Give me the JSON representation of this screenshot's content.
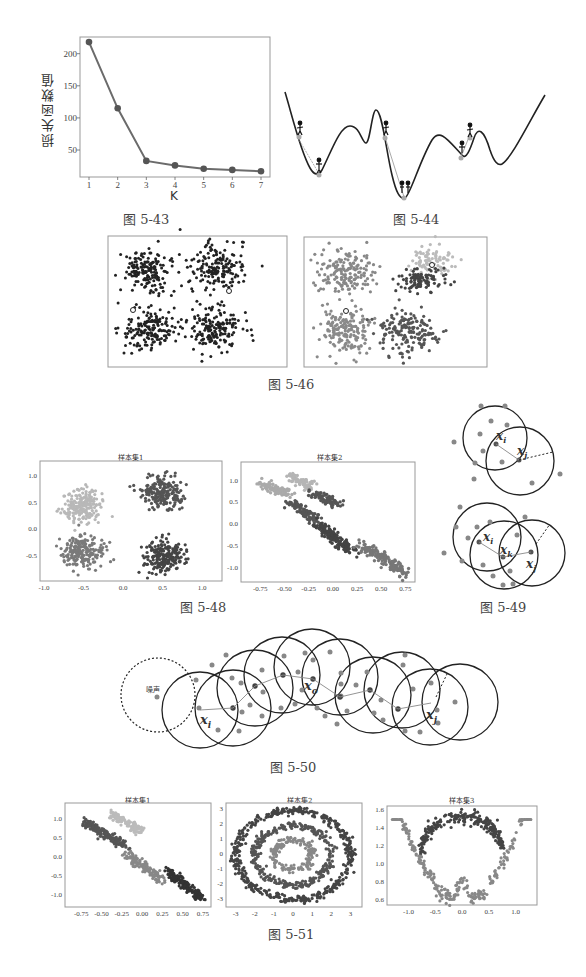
{
  "figures": {
    "fig_5_43": {
      "caption": "图 5-43",
      "ylabel": "损失函数值",
      "xlabel": "K",
      "y_ticks": [
        "200",
        "150",
        "100",
        "50"
      ],
      "x_ticks": [
        "1",
        "2",
        "3",
        "4",
        "5",
        "6",
        "7"
      ]
    },
    "fig_5_44": {
      "caption": "图 5-44"
    },
    "fig_5_46": {
      "caption": "图 5-46"
    },
    "fig_5_48": {
      "caption": "图 5-48",
      "left": {
        "title": "样本集1",
        "y_ticks": [
          "1.0",
          "0.5",
          "0.0",
          "-0.5"
        ],
        "x_ticks": [
          "-1.0",
          "-0.5",
          "0.0",
          "0.5",
          "1.0"
        ]
      },
      "right": {
        "title": "样本集2",
        "y_ticks": [
          "1.0",
          "0.5",
          "0.0",
          "-0.5",
          "-1.0"
        ],
        "x_ticks": [
          "-0.75",
          "-0.50",
          "-0.25",
          "0.00",
          "0.25",
          "0.50",
          "0.75"
        ]
      }
    },
    "fig_5_49": {
      "caption": "图 5-49",
      "labels": {
        "xi": "x",
        "xi_sub": "i",
        "xj": "x",
        "xj_sub": "j",
        "xk": "x",
        "xk_sub": "k",
        "radius": "ε"
      }
    },
    "fig_5_50": {
      "caption": "图 5-50",
      "noise_label": "噪声",
      "labels": {
        "xi": "x",
        "xi_sub": "i",
        "xo": "x",
        "xo_sub": "o",
        "xj": "x",
        "xj_sub": "j",
        "radius": "ε"
      }
    },
    "fig_5_51": {
      "caption": "图 5-51",
      "p1": {
        "title": "样本集1",
        "y_ticks": [
          "1.0",
          "0.5",
          "0.0",
          "-0.5",
          "-1.0"
        ],
        "x_ticks": [
          "-0.75",
          "-0.50",
          "-0.25",
          "0.00",
          "0.25",
          "0.50",
          "0.75"
        ]
      },
      "p2": {
        "title": "样本集2",
        "y_ticks": [
          "3",
          "2",
          "1",
          "0",
          "-1",
          "-2",
          "-3"
        ],
        "x_ticks": [
          "-3",
          "-2",
          "-1",
          "0",
          "1",
          "2",
          "3"
        ]
      },
      "p3": {
        "title": "样本集3",
        "y_ticks": [
          "1.6",
          "1.4",
          "1.2",
          "1.0",
          "0.8",
          "0.6"
        ],
        "x_ticks": [
          "-1.0",
          "-0.5",
          "0.0",
          "0.5",
          "1.0"
        ]
      }
    }
  },
  "chart_data": [
    {
      "type": "line",
      "title": "",
      "xlabel": "K",
      "ylabel": "损失函数值",
      "x": [
        1,
        2,
        3,
        4,
        5,
        6,
        7
      ],
      "values": [
        218,
        115,
        33,
        26,
        21,
        19,
        17
      ],
      "ylim": [
        8,
        226
      ],
      "grid": false,
      "marker": "circle"
    },
    {
      "type": "scatter",
      "title": "样本集1",
      "description": "four Gaussian blobs clustered (fig 5-48 left)",
      "series": [
        {
          "name": "cluster top-left",
          "center": [
            -0.5,
            0.45
          ],
          "color": "#b5b5b5"
        },
        {
          "name": "cluster bottom-left",
          "center": [
            -0.5,
            -0.4
          ],
          "color": "#7a7a7a"
        },
        {
          "name": "cluster top-right",
          "center": [
            0.5,
            0.7
          ],
          "color": "#555555"
        },
        {
          "name": "cluster bottom-right",
          "center": [
            0.5,
            -0.5
          ],
          "color": "#444444"
        }
      ],
      "xlim": [
        -1.05,
        1.25
      ],
      "ylim": [
        -0.95,
        1.3
      ]
    },
    {
      "type": "scatter",
      "title": "样本集2",
      "description": "elongated diagonal clusters (fig 5-48 right)",
      "xlim": [
        -0.95,
        0.85
      ],
      "ylim": [
        -1.3,
        1.45
      ]
    },
    {
      "type": "scatter",
      "title": "样本集1 (fig 5-51)",
      "xlim": [
        -0.95,
        0.85
      ],
      "ylim": [
        -1.3,
        1.45
      ]
    },
    {
      "type": "scatter",
      "title": "样本集2 (fig 5-51)",
      "description": "three concentric rings of radius ~1, ~2, ~3",
      "xlim": [
        -3.5,
        3.6
      ],
      "ylim": [
        -3.5,
        3.5
      ]
    },
    {
      "type": "scatter",
      "title": "样本集3 (fig 5-51)",
      "description": "two interleaving moons",
      "xlim": [
        -1.4,
        1.4
      ],
      "ylim": [
        0.55,
        1.65
      ]
    }
  ]
}
